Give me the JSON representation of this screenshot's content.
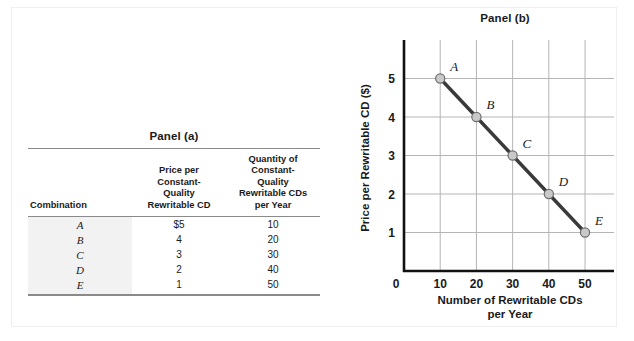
{
  "figure": {
    "panel_a_title": "Panel (a)",
    "panel_b_title": "Panel (b)"
  },
  "table": {
    "headers": {
      "combination": "Combination",
      "price": "Price per\nConstant-\nQuality\nRewritable CD",
      "price_l1": "Price per",
      "price_l2": "Constant-",
      "price_l3": "Quality",
      "price_l4": "Rewritable CD",
      "quantity_l1": "Quantity of",
      "quantity_l2": "Constant-",
      "quantity_l3": "Quality",
      "quantity_l4": "Rewritable CDs",
      "quantity_l5": "per Year"
    },
    "rows": [
      {
        "combination": "A",
        "price": "$5",
        "quantity": "10"
      },
      {
        "combination": "B",
        "price": "4",
        "quantity": "20"
      },
      {
        "combination": "C",
        "price": "3",
        "quantity": "30"
      },
      {
        "combination": "D",
        "price": "2",
        "quantity": "40"
      },
      {
        "combination": "E",
        "price": "1",
        "quantity": "50"
      }
    ]
  },
  "chart_data": {
    "type": "line",
    "title": "Panel (b)",
    "xlabel": "Number of Rewritable CDs per Year",
    "xlabel_l1": "Number of Rewritable CDs",
    "xlabel_l2": "per Year",
    "ylabel": "Price per Rewritable CD ($)",
    "x": [
      10,
      20,
      30,
      40,
      50
    ],
    "values": [
      5,
      4,
      3,
      2,
      1
    ],
    "point_labels": [
      "A",
      "B",
      "C",
      "D",
      "E"
    ],
    "xticks": [
      10,
      20,
      30,
      40,
      50
    ],
    "xtick_labels": [
      "10",
      "20",
      "30",
      "40",
      "50"
    ],
    "yticks": [
      1,
      2,
      3,
      4,
      5
    ],
    "ytick_labels": [
      "1",
      "2",
      "3",
      "4",
      "5"
    ],
    "origin_label": "0",
    "xlim": [
      0,
      58
    ],
    "ylim": [
      0,
      6
    ],
    "grid": true,
    "legend": "none",
    "series_name": "Demand",
    "line_color": "#3a3a3a",
    "marker_fill": "#c9c9c9",
    "marker_edge": "#6e6e6e",
    "grid_color": "#b5b5b5",
    "axis_color": "#111111"
  }
}
